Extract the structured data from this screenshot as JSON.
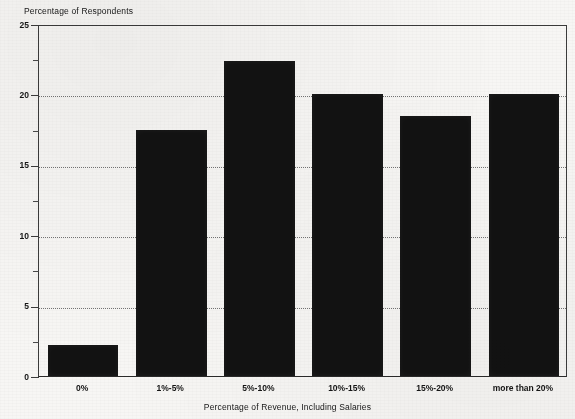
{
  "chart_data": {
    "type": "bar",
    "title": "",
    "categories": [
      "0%",
      "1%-5%",
      "5%-10%",
      "10%-15%",
      "15%-20%",
      "more than 20%"
    ],
    "values": [
      2.2,
      17.5,
      22.4,
      20.0,
      18.5,
      20.0
    ],
    "xlabel": "Percentage of Revenue, Including Salaries",
    "ylabel": "Percentage of Respondents",
    "ylim": [
      0,
      25
    ],
    "ytick_labels": [
      "0",
      "5",
      "10",
      "15",
      "20",
      "25"
    ],
    "ytick_values": [
      0,
      5,
      10,
      15,
      20,
      25
    ],
    "yminor_values": [
      2.5,
      7.5,
      12.5,
      17.5,
      22.5
    ],
    "grid": "horizontal-dotted-major",
    "legend": "none",
    "bar_color": "#121212",
    "background_color": "#f7f6f4",
    "axis_color": "#3b3b3b"
  },
  "axis": {
    "ylabel_text": "Percentage of Respondents",
    "xlabel_text": "Percentage of Revenue, Including Salaries"
  },
  "title_sliver": {
    "text": ""
  }
}
